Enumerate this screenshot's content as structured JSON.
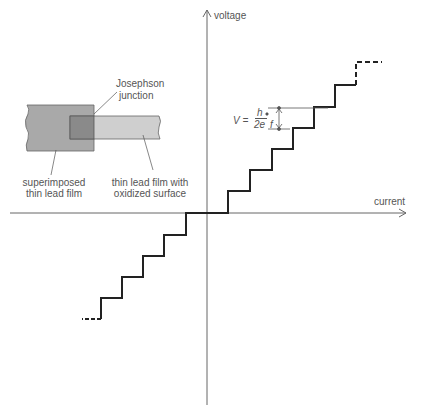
{
  "diagram": {
    "axes": {
      "y_label": "voltage",
      "x_label": "current"
    },
    "inset": {
      "junction_label_line1": "Josephson",
      "junction_label_line2": "junction",
      "superimposed_line1": "superimposed",
      "superimposed_line2": "thin lead film",
      "oxidized_line1": "thin lead film with",
      "oxidized_line2": "oxidized surface"
    },
    "formula": {
      "lhs": "V =",
      "numerator": "h",
      "denominator": "2e",
      "factor": "f"
    },
    "colors": {
      "staircase": "#222222",
      "axis": "#666666",
      "film_dark": "#a9a9a9",
      "film_light": "#cfcfcf",
      "overlap": "#8a8a8a"
    }
  }
}
